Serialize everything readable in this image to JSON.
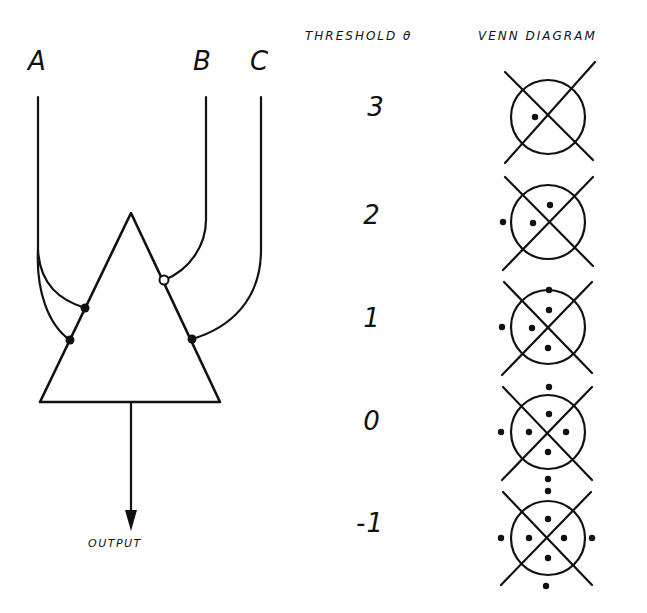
{
  "inputs": [
    {
      "label": "A"
    },
    {
      "label": "B"
    },
    {
      "label": "C"
    }
  ],
  "headers": {
    "threshold": "THRESHOLD θ",
    "venn": "VENN DIAGRAM"
  },
  "output_label": "OUTPUT",
  "colors": {
    "ink": "#111111",
    "background": "#ffffff"
  },
  "neuron": {
    "connections": [
      {
        "input": "A",
        "type": "excitatory",
        "marker": "filled-dot"
      },
      {
        "input": "A",
        "type": "excitatory",
        "marker": "filled-dot"
      },
      {
        "input": "B",
        "type": "inhibitory",
        "marker": "open-circle"
      },
      {
        "input": "C",
        "type": "excitatory",
        "marker": "filled-dot"
      }
    ]
  },
  "rows": [
    {
      "threshold": "3",
      "dots": 1
    },
    {
      "threshold": "2",
      "dots": 3
    },
    {
      "threshold": "1",
      "dots": 5
    },
    {
      "threshold": "0",
      "dots": 7
    },
    {
      "threshold": "-1",
      "dots": 8
    }
  ]
}
